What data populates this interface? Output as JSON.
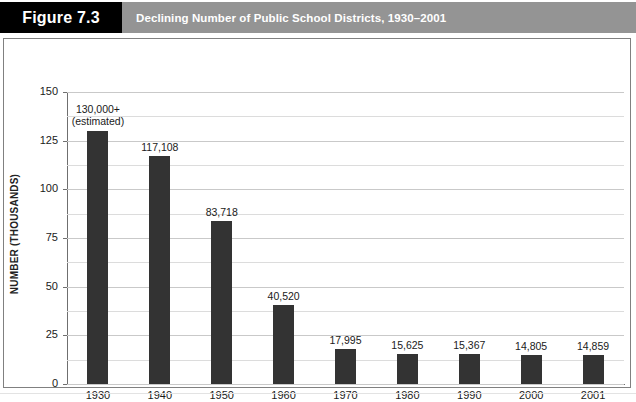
{
  "header": {
    "figure_tag": "Figure 7.3",
    "title": "Declining Number of Public School Districts, 1930–2001",
    "tag_bg": "#000000",
    "strip_bg": "#949494",
    "text_color": "#ffffff"
  },
  "chart_data": {
    "type": "bar",
    "title": "Declining Number of Public School Districts, 1930–2001",
    "xlabel": "YEAR",
    "ylabel": "NUMBER (THOUSANDS)",
    "categories": [
      "1930",
      "1940",
      "1950",
      "1960",
      "1970",
      "1980",
      "1990",
      "2000",
      "2001"
    ],
    "values": [
      130.0,
      117.108,
      83.718,
      40.52,
      17.995,
      15.625,
      15.367,
      14.805,
      14.859
    ],
    "point_labels": [
      "130,000+\n(estimated)",
      "117,108",
      "83,718",
      "40,520",
      "17,995",
      "15,625",
      "15,367",
      "14,805",
      "14,859"
    ],
    "ylim": [
      0,
      150
    ],
    "yticks": [
      0,
      25,
      50,
      75,
      100,
      125,
      150
    ],
    "ytick_labels": [
      "0",
      "25",
      "50",
      "75",
      "100",
      "125",
      "150"
    ],
    "minor_tick_step": 12.5,
    "grid": true,
    "legend": null,
    "bar_color": "#333333",
    "grid_color": "#c9c9c9",
    "axis_color": "#6f6f6f"
  }
}
